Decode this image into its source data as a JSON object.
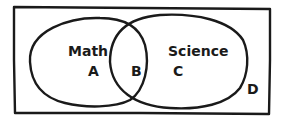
{
  "diagram": {
    "type": "venn",
    "universe": {
      "label": "D"
    },
    "sets": [
      {
        "name": "Math",
        "region_label": "A"
      },
      {
        "name": "Science",
        "region_label": "C"
      }
    ],
    "intersection": {
      "label": "B"
    },
    "colors": {
      "stroke": "#1a1a1a",
      "background": "#ffffff"
    }
  }
}
